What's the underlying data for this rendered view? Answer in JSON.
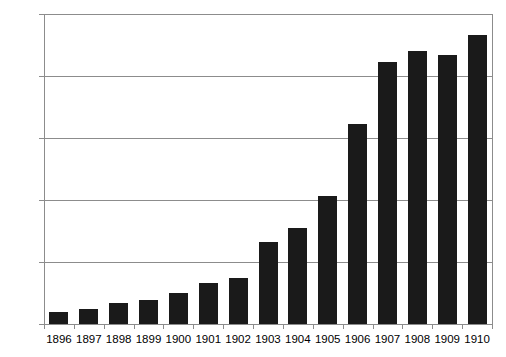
{
  "chart_data": {
    "type": "bar",
    "title": "",
    "xlabel": "",
    "ylabel": "",
    "categories": [
      "1896",
      "1897",
      "1898",
      "1899",
      "1900",
      "1901",
      "1902",
      "1903",
      "1904",
      "1905",
      "1906",
      "1907",
      "1908",
      "1909",
      "1910"
    ],
    "values": [
      60,
      75,
      100,
      115,
      150,
      200,
      225,
      395,
      465,
      620,
      970,
      1270,
      1320,
      1300,
      1400
    ],
    "ylim": [
      0,
      1500
    ],
    "yticks": [
      0,
      300,
      600,
      900,
      1200,
      1500
    ],
    "ytick_labels": [
      "0",
      "300",
      "600",
      "900",
      "1,200",
      "1,500"
    ],
    "grid": true,
    "legend": false,
    "bar_color": "#1a1a1a",
    "grid_color": "#8c8c8c",
    "axis_color": "#8c8c8c",
    "background_color": "#ffffff"
  }
}
